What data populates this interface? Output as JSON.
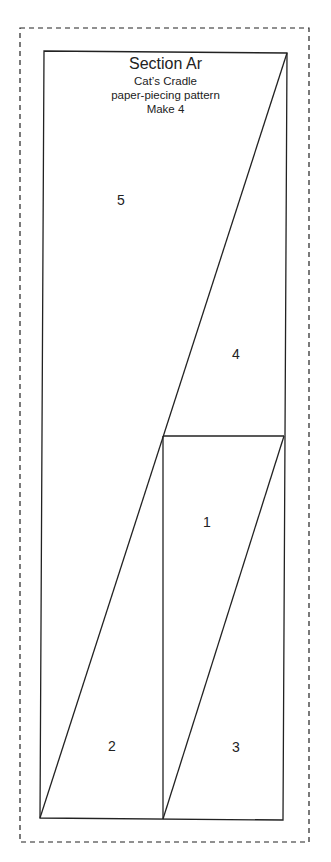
{
  "pattern": {
    "title": "Section Ar",
    "subtitle_lines": [
      "Cat’s Cradle",
      "paper-piecing pattern",
      "Make 4"
    ],
    "colors": {
      "line": "#222222",
      "background": "#ffffff"
    },
    "outline": {
      "seam_allowance_dashed": {
        "x1": 20,
        "y1": 28,
        "x2": 309,
        "y2": 842
      },
      "piece_border": [
        [
          44,
          51
        ],
        [
          287,
          53
        ],
        [
          283,
          820
        ],
        [
          40,
          818
        ]
      ]
    },
    "seams": [
      {
        "from": [
          287,
          53
        ],
        "to": [
          40,
          818
        ]
      },
      {
        "from": [
          163,
          436
        ],
        "to": [
          284,
          436
        ]
      },
      {
        "from": [
          163,
          436
        ],
        "to": [
          163,
          819
        ]
      },
      {
        "from": [
          284,
          436
        ],
        "to": [
          163,
          819
        ]
      }
    ],
    "pieces": [
      {
        "label": "1",
        "x": 207,
        "y": 522
      },
      {
        "label": "2",
        "x": 112,
        "y": 746
      },
      {
        "label": "3",
        "x": 236,
        "y": 747
      },
      {
        "label": "4",
        "x": 236,
        "y": 354
      },
      {
        "label": "5",
        "x": 121,
        "y": 200
      }
    ]
  }
}
